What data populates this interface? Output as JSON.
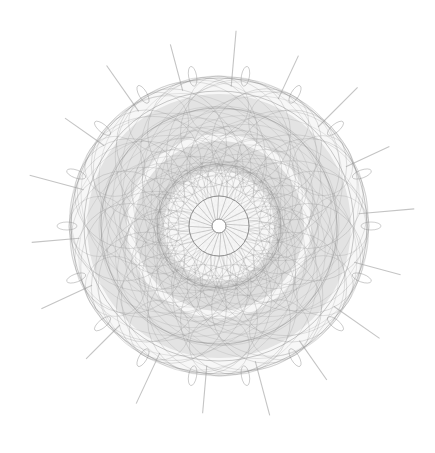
{
  "artwork": {
    "type": "spirograph-rosette",
    "background": "#ffffff",
    "stroke_color": "#8a8a8a",
    "center": [
      219,
      226
    ],
    "outer_radius": 150,
    "spike_count": 18,
    "spike_inner_radius": 140,
    "spike_outer_radius": 196,
    "hub_radius": 7,
    "spoke_ring_radius": 30,
    "spoke_count": 24,
    "loop_count": 18,
    "loop_radius": 152
  }
}
